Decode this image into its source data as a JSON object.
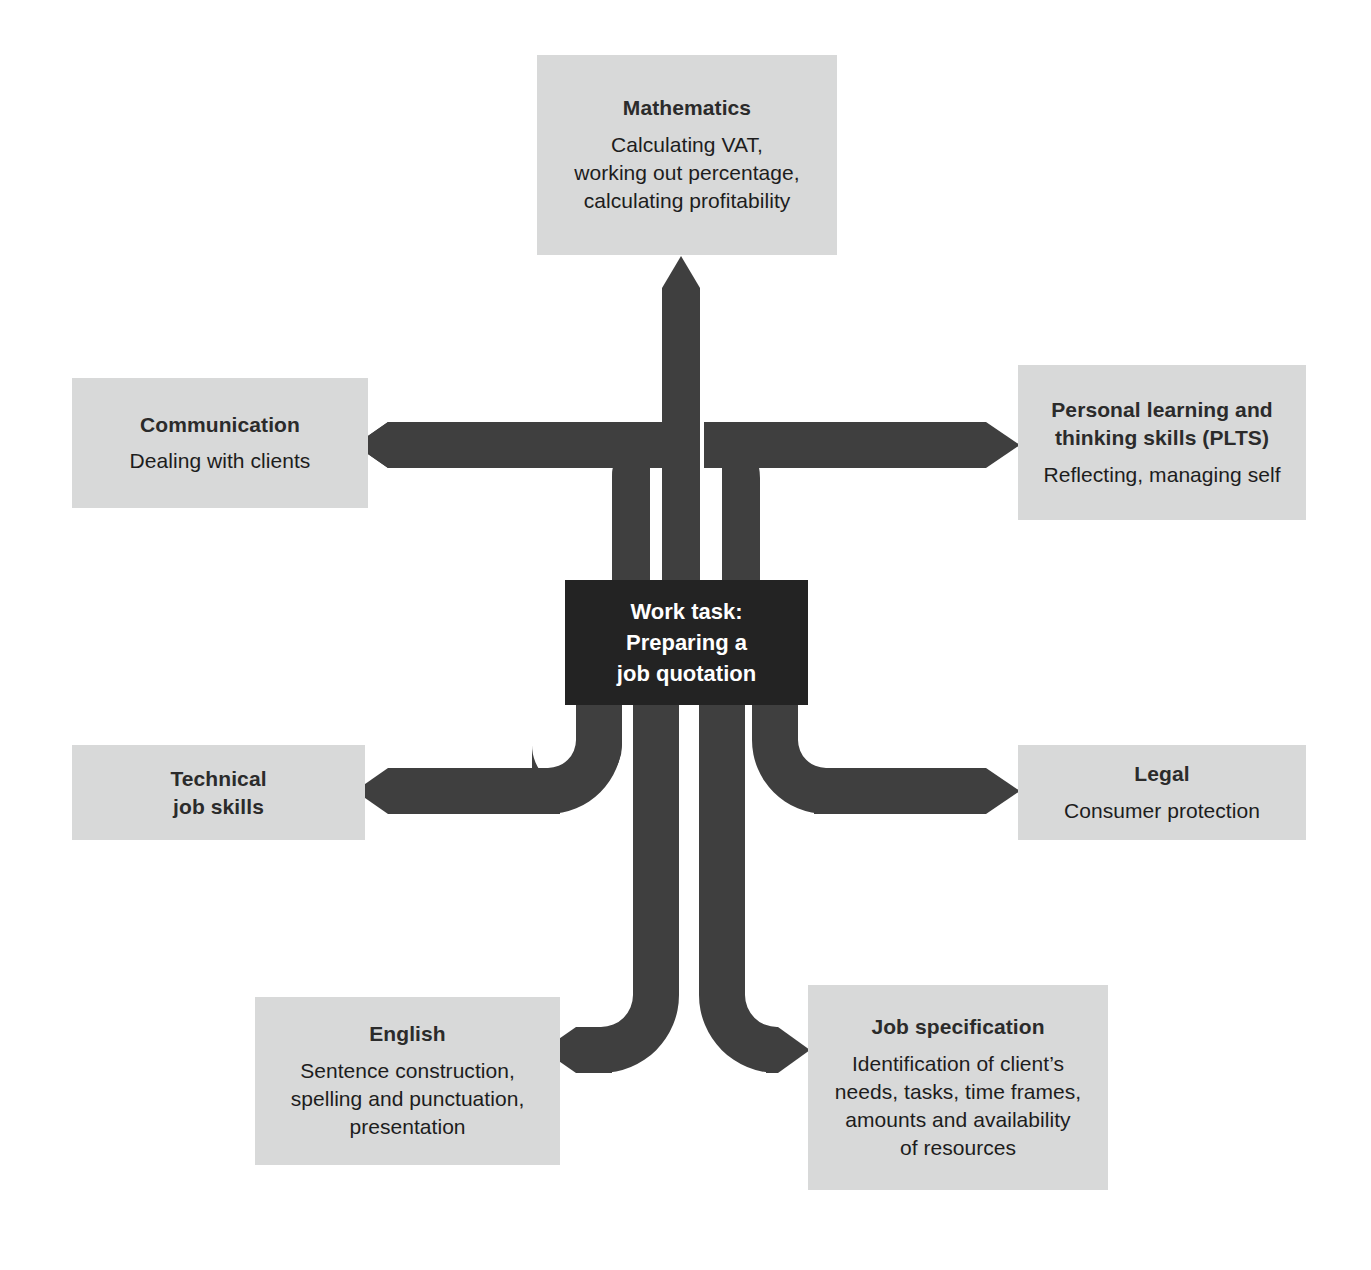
{
  "diagram": {
    "colors": {
      "node_fill": "#d8d9d9",
      "node_text": "#1d1d1d",
      "center_fill": "#232323",
      "center_text": "#ffffff",
      "arrow_fill": "#3f3f3f",
      "background": "#ffffff"
    },
    "center": {
      "name": "work-task",
      "lines": [
        "Work task:",
        "Preparing a",
        "job quotation"
      ]
    },
    "nodes": [
      {
        "id": "mathematics",
        "title": "Mathematics",
        "desc": "Calculating VAT,\nworking out percentage,\ncalculating profitability",
        "direction": "up"
      },
      {
        "id": "communication",
        "title": "Communication",
        "desc": "Dealing with clients",
        "direction": "left-upper"
      },
      {
        "id": "plts",
        "title": "Personal learning and\nthinking skills (PLTS)",
        "desc": "Reflecting, managing self",
        "direction": "right-upper"
      },
      {
        "id": "technical",
        "title": "Technical\njob skills",
        "desc": "",
        "direction": "left-lower"
      },
      {
        "id": "legal",
        "title": "Legal",
        "desc": "Consumer protection",
        "direction": "right-lower"
      },
      {
        "id": "english",
        "title": "English",
        "desc": "Sentence construction,\nspelling and punctuation,\npresentation",
        "direction": "down-left"
      },
      {
        "id": "jobspec",
        "title": "Job specification",
        "desc": "Identification of client’s\nneeds, tasks, time frames,\namounts and availability\nof resources",
        "direction": "down-right"
      }
    ]
  }
}
